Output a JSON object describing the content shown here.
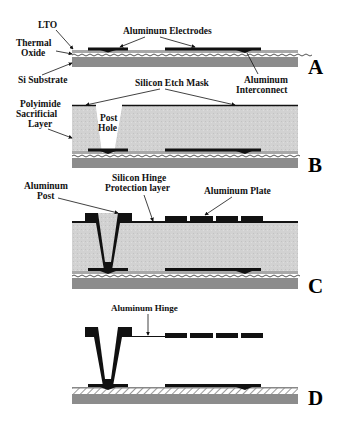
{
  "figure": {
    "type": "MEMS fabrication process cross-section",
    "steps": [
      {
        "id": "A",
        "label": "A"
      },
      {
        "id": "B",
        "label": "B"
      },
      {
        "id": "C",
        "label": "C"
      },
      {
        "id": "D",
        "label": "D"
      }
    ]
  },
  "labels": {
    "lto": "LTO",
    "thermal_oxide_1": "Thermal",
    "thermal_oxide_2": "Oxide",
    "si_substrate": "Si Substrate",
    "aluminum_electrodes": "Aluminum Electrodes",
    "aluminum_interconnect_1": "Aluminum",
    "aluminum_interconnect_2": "Interconnect",
    "silicon_etch_mask": "Silicon Etch Mask",
    "polyimide_1": "Polyimide",
    "polyimide_2": "Sacrificial",
    "polyimide_3": "Layer",
    "post_hole_1": "Post",
    "post_hole_2": "Hole",
    "aluminum_post_1": "Aluminum",
    "aluminum_post_2": "Post",
    "hinge_protection_1": "Silicon Hinge",
    "hinge_protection_2": "Protection layer",
    "aluminum_plate": "Aluminum Plate",
    "aluminum_hinge": "Aluminum Hinge"
  },
  "colors": {
    "substrate": "#8c8c8c",
    "lto": "#a8a8a8",
    "polyimide": "#d4d4d4",
    "metal": "#111111",
    "background": "#ffffff"
  }
}
